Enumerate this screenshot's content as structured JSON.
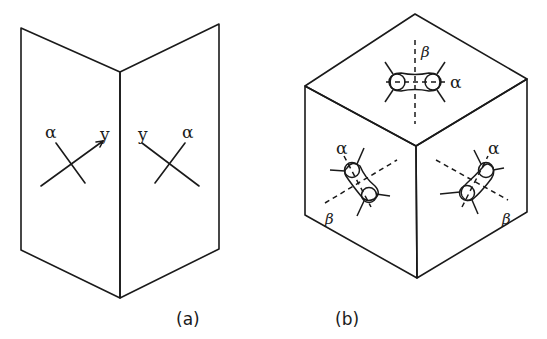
{
  "figure": {
    "panels": [
      {
        "id": "a",
        "caption": "(a)",
        "description": "Two hinged planes (folded sheet) with crossed axes",
        "labels": {
          "left_alpha": "α",
          "left_y": "y",
          "right_y": "y",
          "right_alpha": "α"
        }
      },
      {
        "id": "b",
        "caption": "(b)",
        "description": "Cube with molecules on three visible faces, each with α axis and dashed β axis",
        "labels": {
          "top_beta": "β",
          "top_alpha": "α",
          "left_alpha": "α",
          "left_beta": "β",
          "right_alpha": "α",
          "right_beta": "β"
        }
      }
    ]
  }
}
